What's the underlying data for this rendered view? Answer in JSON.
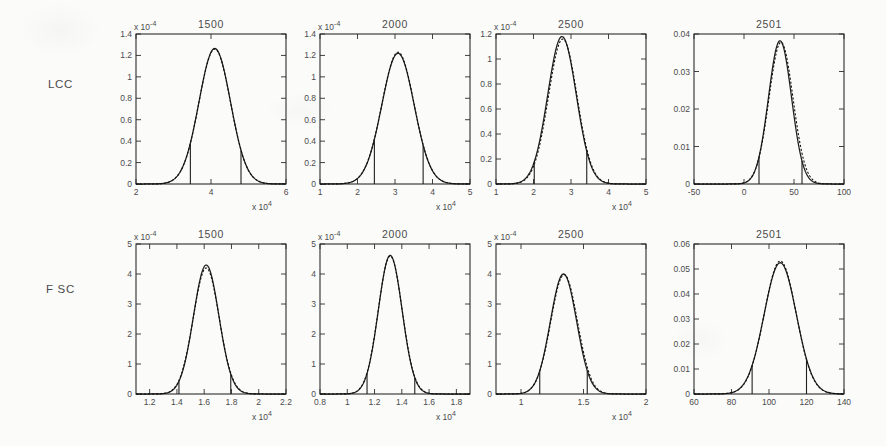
{
  "figure": {
    "rows": [
      {
        "label": "LCC"
      },
      {
        "label": "F SC"
      }
    ],
    "column_titles": [
      "1500",
      "2000",
      "2500",
      "2501"
    ]
  },
  "chart_data": [
    {
      "type": "line",
      "row": "LCC",
      "title": "1500",
      "xlabel": "x 10⁴",
      "ylabel": "",
      "y_multiplier": "x 10⁻⁴",
      "x_multiplier": "x 10⁴",
      "xlim": [
        2,
        6
      ],
      "ylim": [
        0,
        0.00014
      ],
      "xticks": [
        2,
        4,
        6
      ],
      "xticklabels": [
        "2",
        "4",
        "6"
      ],
      "yticks": [
        0,
        0.2,
        0.4,
        0.6,
        0.8,
        1.0,
        1.2,
        1.4
      ],
      "yticklabels": [
        "0",
        "0.2",
        "0.4",
        "0.6",
        "0.8",
        "1",
        "1.2",
        "1.4"
      ],
      "grid": false,
      "legend": "none",
      "series": [
        {
          "name": "histogram",
          "style": "solid",
          "mean": 4.1,
          "sigma": 0.42,
          "peak": 1.265
        },
        {
          "name": "gaussian-fit",
          "style": "dashed",
          "mean": 4.1,
          "sigma": 0.42,
          "peak": 1.26
        }
      ],
      "gates": [
        3.45,
        4.8
      ]
    },
    {
      "type": "line",
      "row": "LCC",
      "title": "2000",
      "xlabel": "x 10⁴",
      "ylabel": "",
      "y_multiplier": "x 10⁻⁴",
      "x_multiplier": "x 10⁴",
      "xlim": [
        1,
        5
      ],
      "ylim": [
        0,
        0.00014
      ],
      "xticks": [
        1,
        2,
        3,
        4,
        5
      ],
      "xticklabels": [
        "1",
        "2",
        "3",
        "4",
        "5"
      ],
      "yticks": [
        0,
        0.2,
        0.4,
        0.6,
        0.8,
        1.0,
        1.2,
        1.4
      ],
      "yticklabels": [
        "0",
        "0.2",
        "0.4",
        "0.6",
        "0.8",
        "1",
        "1.2",
        "1.4"
      ],
      "grid": false,
      "legend": "none",
      "series": [
        {
          "name": "histogram",
          "style": "solid",
          "mean": 3.08,
          "sigma": 0.43,
          "peak": 1.22
        },
        {
          "name": "gaussian-fit",
          "style": "dashed",
          "mean": 3.08,
          "sigma": 0.43,
          "peak": 1.23
        }
      ],
      "gates": [
        2.45,
        3.75
      ]
    },
    {
      "type": "line",
      "row": "LCC",
      "title": "2500",
      "xlabel": "x 10⁴",
      "ylabel": "",
      "y_multiplier": "x 10⁻⁴",
      "x_multiplier": "x 10⁴",
      "xlim": [
        1,
        5
      ],
      "ylim": [
        0,
        0.00012
      ],
      "xticks": [
        1,
        2,
        3,
        4,
        5
      ],
      "xticklabels": [
        "1",
        "2",
        "3",
        "4",
        "5"
      ],
      "yticks": [
        0,
        0.2,
        0.4,
        0.6,
        0.8,
        1.0,
        1.2
      ],
      "yticklabels": [
        "0",
        "0.2",
        "0.4",
        "0.6",
        "0.8",
        "1",
        "1.2"
      ],
      "grid": false,
      "legend": "none",
      "series": [
        {
          "name": "histogram",
          "style": "solid",
          "mean": 2.76,
          "sigma": 0.38,
          "peak": 1.18
        },
        {
          "name": "gaussian-fit",
          "style": "dashed",
          "mean": 2.78,
          "sigma": 0.38,
          "peak": 1.16
        }
      ],
      "gates": [
        2.02,
        3.42
      ]
    },
    {
      "type": "line",
      "row": "LCC",
      "title": "2501",
      "xlabel": "",
      "ylabel": "",
      "y_multiplier": "",
      "x_multiplier": "",
      "xlim": [
        -50,
        100
      ],
      "ylim": [
        0,
        0.04
      ],
      "xticks": [
        -50,
        0,
        50,
        100
      ],
      "xticklabels": [
        "-50",
        "0",
        "50",
        "100"
      ],
      "yticks": [
        0,
        0.01,
        0.02,
        0.03,
        0.04
      ],
      "yticklabels": [
        "0",
        "0.01",
        "0.02",
        "0.03",
        "0.04"
      ],
      "grid": false,
      "legend": "none",
      "series": [
        {
          "name": "histogram",
          "style": "solid",
          "mean": 36,
          "sigma": 11.5,
          "peak": 0.0382
        },
        {
          "name": "gaussian-fit",
          "style": "dashed",
          "mean": 37,
          "sigma": 12.0,
          "peak": 0.0378
        }
      ],
      "gates": [
        15,
        58
      ]
    },
    {
      "type": "line",
      "row": "FSC",
      "title": "1500",
      "xlabel": "x 10⁴",
      "ylabel": "",
      "y_multiplier": "x 10⁻⁴",
      "x_multiplier": "x 10⁴",
      "xlim": [
        1.1,
        2.2
      ],
      "ylim": [
        0,
        0.0005
      ],
      "xticks": [
        1.2,
        1.4,
        1.6,
        1.8,
        2.0,
        2.2
      ],
      "xticklabels": [
        "1.2",
        "1.4",
        "1.6",
        "1.8",
        "2",
        "2.2"
      ],
      "yticks": [
        0,
        1,
        2,
        3,
        4,
        5
      ],
      "yticklabels": [
        "0",
        "1",
        "2",
        "3",
        "4",
        "5"
      ],
      "grid": false,
      "legend": "none",
      "series": [
        {
          "name": "histogram",
          "style": "solid",
          "mean": 1.615,
          "sigma": 0.093,
          "peak": 4.3
        },
        {
          "name": "gaussian-fit",
          "style": "dashed",
          "mean": 1.615,
          "sigma": 0.095,
          "peak": 4.2
        }
      ],
      "gates": [
        1.415,
        1.795
      ]
    },
    {
      "type": "line",
      "row": "FSC",
      "title": "2000",
      "xlabel": "x 10⁴",
      "ylabel": "",
      "y_multiplier": "x 10⁻⁴",
      "x_multiplier": "x 10⁴",
      "xlim": [
        0.8,
        1.9
      ],
      "ylim": [
        0,
        0.0005
      ],
      "xticks": [
        0.8,
        1.0,
        1.2,
        1.4,
        1.6,
        1.8
      ],
      "xticklabels": [
        "0.8",
        "1",
        "1.2",
        "1.4",
        "1.6",
        "1.8"
      ],
      "yticks": [
        0,
        1,
        2,
        3,
        4,
        5
      ],
      "yticklabels": [
        "0",
        "1",
        "2",
        "3",
        "4",
        "5"
      ],
      "grid": false,
      "legend": "none",
      "series": [
        {
          "name": "histogram",
          "style": "solid",
          "mean": 1.315,
          "sigma": 0.087,
          "peak": 4.62
        },
        {
          "name": "gaussian-fit",
          "style": "dashed",
          "mean": 1.315,
          "sigma": 0.088,
          "peak": 4.6
        }
      ],
      "gates": [
        1.145,
        1.495
      ]
    },
    {
      "type": "line",
      "row": "FSC",
      "title": "2500",
      "xlabel": "x 10⁴",
      "ylabel": "",
      "y_multiplier": "x 10⁻⁴",
      "x_multiplier": "x 10⁴",
      "xlim": [
        0.8,
        2.0
      ],
      "ylim": [
        0,
        0.0005
      ],
      "xticks": [
        1.0,
        1.5,
        2.0
      ],
      "xticklabels": [
        "1",
        "1.5",
        "2"
      ],
      "yticks": [
        0,
        1,
        2,
        3,
        4,
        5
      ],
      "yticklabels": [
        "0",
        "1",
        "2",
        "3",
        "4",
        "5"
      ],
      "grid": false,
      "legend": "none",
      "series": [
        {
          "name": "histogram",
          "style": "solid",
          "mean": 1.34,
          "sigma": 0.105,
          "peak": 4.0
        },
        {
          "name": "gaussian-fit",
          "style": "dashed",
          "mean": 1.345,
          "sigma": 0.107,
          "peak": 3.98
        }
      ],
      "gates": [
        1.15,
        1.53
      ]
    },
    {
      "type": "line",
      "row": "FSC",
      "title": "2501",
      "xlabel": "",
      "ylabel": "",
      "y_multiplier": "",
      "x_multiplier": "",
      "xlim": [
        60,
        140
      ],
      "ylim": [
        0,
        0.06
      ],
      "xticks": [
        60,
        80,
        100,
        120,
        140
      ],
      "xticklabels": [
        "60",
        "80",
        "100",
        "120",
        "140"
      ],
      "yticks": [
        0,
        0.01,
        0.02,
        0.03,
        0.04,
        0.05,
        0.06
      ],
      "yticklabels": [
        "0",
        "0.01",
        "0.02",
        "0.03",
        "0.04",
        "0.05",
        "0.06"
      ],
      "grid": false,
      "legend": "none",
      "series": [
        {
          "name": "histogram",
          "style": "solid",
          "mean": 106,
          "sigma": 8.6,
          "peak": 0.0525
        },
        {
          "name": "gaussian-fit",
          "style": "dashed",
          "mean": 106,
          "sigma": 8.5,
          "peak": 0.0532
        }
      ],
      "gates": [
        91,
        120
      ]
    }
  ]
}
